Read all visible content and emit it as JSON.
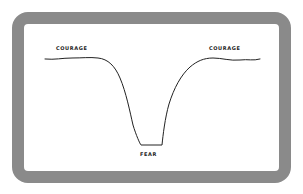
{
  "diagram": {
    "type": "line-sketch",
    "labels": {
      "left": "COURAGE",
      "right": "COURAGE",
      "bottom": "FEAR"
    },
    "colors": {
      "frame": "#8a8a8a",
      "line": "#222222",
      "background": "#ffffff"
    }
  }
}
